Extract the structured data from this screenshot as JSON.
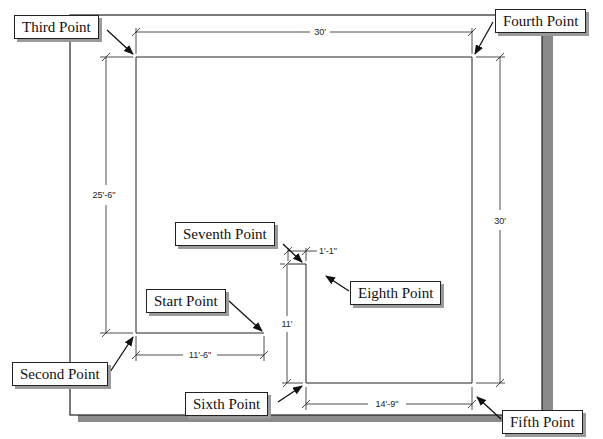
{
  "callouts": {
    "start": "Start Point",
    "second": "Second Point",
    "third": "Third Point",
    "fourth": "Fourth Point",
    "fifth": "Fifth Point",
    "sixth": "Sixth Point",
    "seventh": "Seventh Point",
    "eighth": "Eighth Point"
  },
  "dimensions": {
    "top_width": "30'",
    "left_height": "25'-6\"",
    "right_height": "30'",
    "bottom_left_width": "11'-6\"",
    "bottom_right_width": "14'-9\"",
    "inner_height": "11'",
    "notch_width": "1'-1\""
  },
  "colors": {
    "line": "#222222",
    "shadow": "#8a8a8a",
    "background": "#ffffff"
  }
}
